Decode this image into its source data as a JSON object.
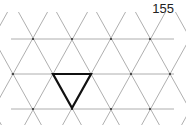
{
  "page": {
    "number": "155"
  },
  "diagram": {
    "type": "triangular-lattice",
    "line_color": "#9a9a9a",
    "vertex_color": "#333333",
    "highlight_color": "#111111",
    "rows_y": [
      39,
      74,
      109
    ],
    "row_vertices": [
      [
        33,
        72,
        111,
        150
      ],
      [
        13,
        53,
        91,
        131,
        170
      ],
      [
        33,
        72,
        111,
        150
      ]
    ],
    "highlighted_triangle": {
      "orientation": "downward",
      "vertices": [
        [
          53,
          74
        ],
        [
          91,
          74
        ],
        [
          72,
          108
        ]
      ]
    }
  }
}
